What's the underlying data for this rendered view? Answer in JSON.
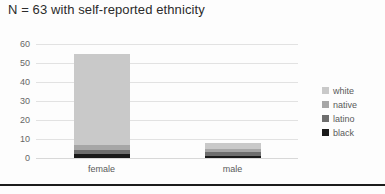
{
  "chart_data": {
    "type": "bar",
    "stacked": true,
    "title": "N = 63 with self-reported ethnicity",
    "xlabel": "",
    "ylabel": "",
    "categories": [
      "female",
      "male"
    ],
    "ylim": [
      0,
      60
    ],
    "yticks": [
      0,
      10,
      20,
      30,
      40,
      50,
      60
    ],
    "grid": true,
    "legend_position": "right",
    "series": [
      {
        "name": "black",
        "values": [
          2,
          1
        ],
        "color": "#1a1a1a"
      },
      {
        "name": "latino",
        "values": [
          2,
          2
        ],
        "color": "#6e6e6e"
      },
      {
        "name": "native",
        "values": [
          3,
          2
        ],
        "color": "#a6a6a6"
      },
      {
        "name": "white",
        "values": [
          48,
          3
        ],
        "color": "#c9c9c9"
      }
    ],
    "totals": [
      55,
      8
    ]
  },
  "legend": {
    "items": [
      {
        "label": "white",
        "color": "#c9c9c9"
      },
      {
        "label": "native",
        "color": "#a6a6a6"
      },
      {
        "label": "latino",
        "color": "#6e6e6e"
      },
      {
        "label": "black",
        "color": "#1a1a1a"
      }
    ]
  },
  "colors": {
    "grid": "#e2e2e2",
    "axis_text": "#666666",
    "title_text": "#2b2b2b",
    "background": "#fdfdfd",
    "rule": "#1c1c1c"
  }
}
